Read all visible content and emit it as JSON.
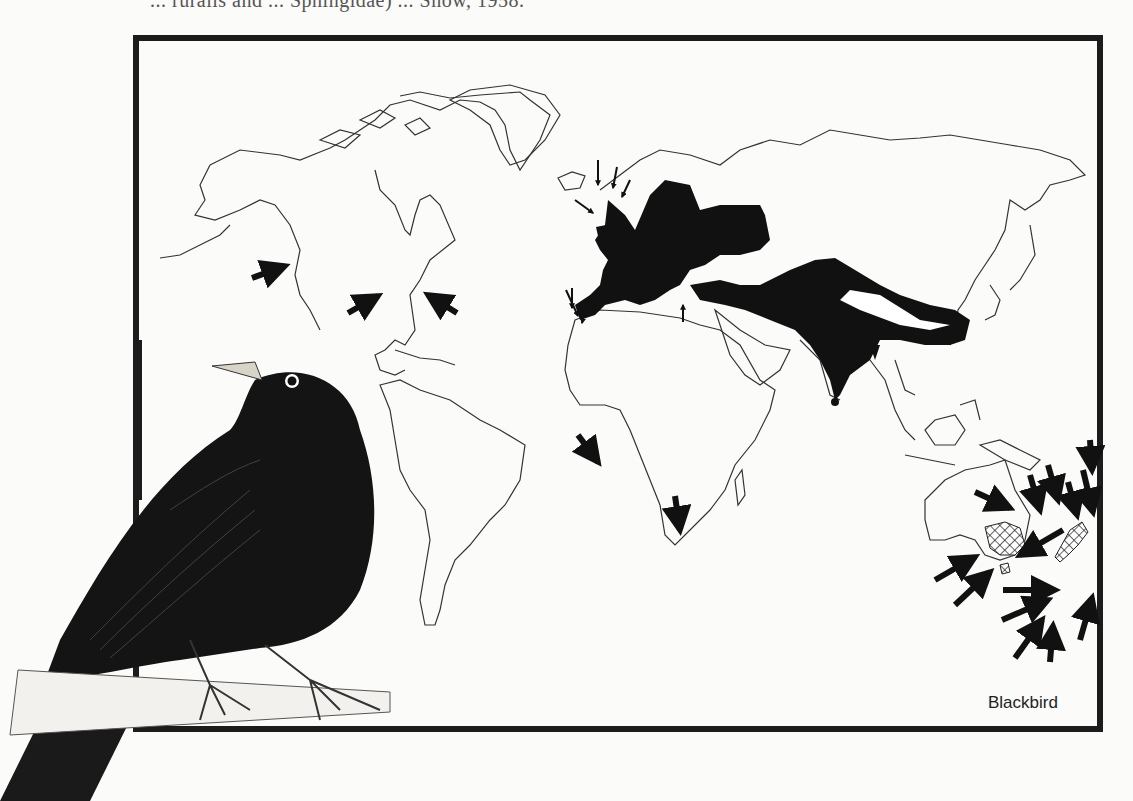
{
  "header": {
    "cropped_text": "... ruralis and ... Sphingidae) ... Snow, 1958."
  },
  "map": {
    "title_label": "Blackbird",
    "colors": {
      "native_range": "#111111",
      "introduced_range_hatch": "#222222",
      "coastline": "#333333",
      "frame": "#1c1c1c",
      "background": "#fbfbfa"
    },
    "legend": [
      {
        "symbol": "solid-black",
        "meaning": "native breeding range"
      },
      {
        "symbol": "cross-hatch",
        "meaning": "introduced range"
      },
      {
        "symbol": "arrow",
        "meaning": "vagrant / occurrence records"
      }
    ],
    "regions_marked": [
      "Europe",
      "North Africa",
      "Middle East",
      "Central Asia",
      "India",
      "South China",
      "SE Australia",
      "Tasmania",
      "New Zealand"
    ],
    "arrow_locations": [
      "Pacific NW America",
      "Great Lakes",
      "US East Coast",
      "Iceland",
      "Faroe Islands",
      "Norway coast",
      "Ireland",
      "Azores",
      "Canary Islands",
      "Madeira",
      "Eastern Mediterranean",
      "Gulf of Guinea",
      "South Africa",
      "Burma",
      "Lord Howe Island",
      "Norfolk Island",
      "Kermadec Islands",
      "Chatham Islands",
      "Subantarctic Islands"
    ]
  },
  "illustration": {
    "subject": "Blackbird perched on branch"
  }
}
